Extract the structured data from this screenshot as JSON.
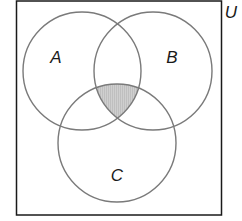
{
  "diagram": {
    "type": "venn",
    "universe": {
      "label": "U",
      "x": 16,
      "y": 1,
      "width": 205,
      "height": 214
    },
    "sets": [
      {
        "label": "A",
        "cx": 82,
        "cy": 71,
        "r": 59,
        "label_x": 56,
        "label_y": 63
      },
      {
        "label": "B",
        "cx": 153,
        "cy": 71,
        "r": 59,
        "label_x": 172,
        "label_y": 63
      },
      {
        "label": "C",
        "cx": 117,
        "cy": 143,
        "r": 59,
        "label_x": 117,
        "label_y": 180
      }
    ],
    "shaded_region": "A ∩ B ∩ C",
    "colors": {
      "stroke": "#7a7a7a",
      "border": "#1a1a1a",
      "shade": "#c8c8c8",
      "background": "#ffffff"
    }
  }
}
